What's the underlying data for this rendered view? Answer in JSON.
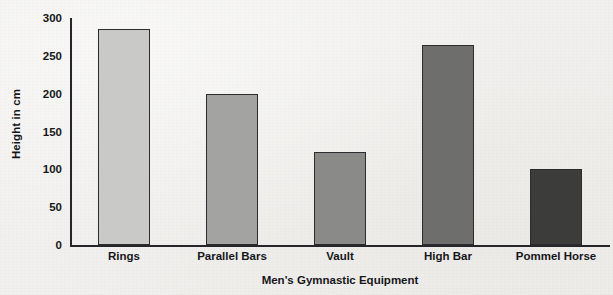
{
  "chart_data": {
    "type": "bar",
    "title": "",
    "xlabel": "Men's Gymnastic Equipment",
    "ylabel": "Height in cm",
    "categories": [
      "Rings",
      "Parallel Bars",
      "Vault",
      "High Bar",
      "Pommel Horse"
    ],
    "values": [
      285,
      200,
      123,
      264,
      100
    ],
    "ylim": [
      0,
      300
    ],
    "yticks": [
      0,
      50,
      100,
      150,
      200,
      250,
      300
    ],
    "ytick_labels": [
      "0",
      "50",
      "100",
      "150",
      "200",
      "250",
      "300"
    ],
    "grid": false,
    "legend": "none",
    "bar_colors": [
      "#c9c9c7",
      "#a3a3a1",
      "#8a8a88",
      "#6e6e6d",
      "#3c3c3b"
    ],
    "bar_edge_color": "#2a2c30",
    "axis_color": "#24262a",
    "background_color": "#f1f0ee",
    "text_color": "#16171a"
  }
}
